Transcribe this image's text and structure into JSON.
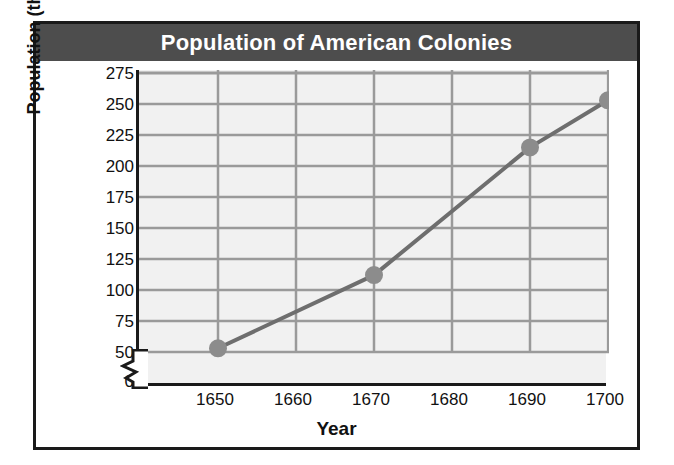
{
  "chart_data": {
    "type": "line",
    "title": "Population of American Colonies",
    "xlabel": "Year",
    "ylabel": "Population (thousands)",
    "x": [
      1650,
      1670,
      1690,
      1700
    ],
    "values": [
      53,
      112,
      215,
      253
    ],
    "series": [
      {
        "name": "Population of American Colonies",
        "values": [
          53,
          112,
          215,
          253
        ]
      }
    ],
    "xticks": [
      "1650",
      "1660",
      "1670",
      "1680",
      "1690",
      "1700"
    ],
    "xtick_values": [
      1650,
      1660,
      1670,
      1680,
      1690,
      1700
    ],
    "yticks": [
      "0",
      "50",
      "75",
      "100",
      "125",
      "150",
      "175",
      "200",
      "225",
      "250",
      "275"
    ],
    "ytick_values": [
      0,
      50,
      75,
      100,
      125,
      150,
      175,
      200,
      225,
      250,
      275
    ],
    "xlim": [
      1645,
      1700
    ],
    "ylim": [
      50,
      275
    ],
    "y_axis_break": true,
    "grid": true,
    "legend": "none",
    "colors": {
      "title_bar": "#4d4d4d",
      "title_text": "#ffffff",
      "frame": "#1a1a1a",
      "plot_background": "#f1f1f1",
      "gridline": "#9a9a9a",
      "line": "#6e6e6e",
      "marker": "#8c8c8c",
      "tick_text": "#111111"
    }
  },
  "figure": {
    "title": "Population of American Colonies",
    "x_axis_title": "Year",
    "y_axis_title": "Population (thousands)"
  }
}
